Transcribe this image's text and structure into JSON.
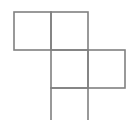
{
  "diagram": {
    "title": "",
    "type": "square-grid-net",
    "stroke_color": "#808080",
    "background_color": "#ffffff",
    "stroke_width": 1.6,
    "cell_size": 37,
    "cells": [
      {
        "id": "cell-a",
        "row": 0,
        "col": 0,
        "x": 14,
        "y": 12,
        "w": 37,
        "h": 38,
        "open_bottom": false
      },
      {
        "id": "cell-b",
        "row": 0,
        "col": 1,
        "x": 51,
        "y": 12,
        "w": 37,
        "h": 38,
        "open_bottom": false
      },
      {
        "id": "cell-c",
        "row": 1,
        "col": 1,
        "x": 51,
        "y": 50,
        "w": 37,
        "h": 38,
        "open_bottom": false
      },
      {
        "id": "cell-d",
        "row": 1,
        "col": 2,
        "x": 88,
        "y": 50,
        "w": 37,
        "h": 38,
        "open_bottom": false
      },
      {
        "id": "cell-e",
        "row": 2,
        "col": 1,
        "x": 51,
        "y": 88,
        "w": 37,
        "h": 40,
        "open_bottom": true
      }
    ]
  }
}
